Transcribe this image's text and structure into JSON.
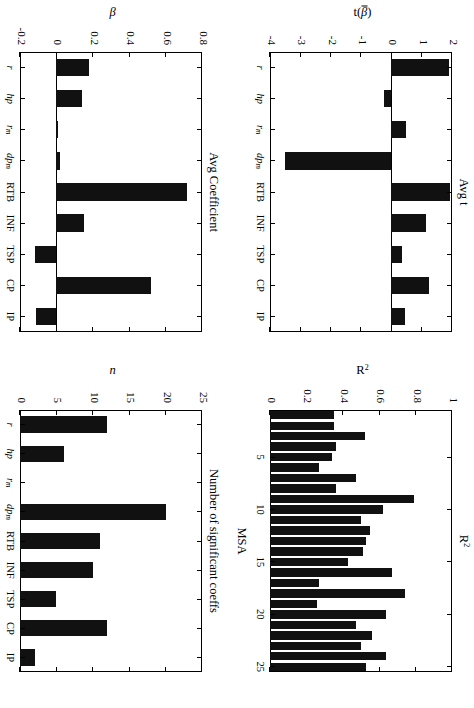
{
  "figure": {
    "orientation": "rotated-90-clockwise",
    "panel_count": 4
  },
  "chart_data": [
    {
      "id": "avg-t",
      "type": "bar",
      "title": "Avg t",
      "xlabel": "",
      "ylabel": "t(β̄)",
      "ylabel_parts": {
        "prefix": "t(",
        "symbol": "β",
        "suffix": ")",
        "overline": true
      },
      "categories": [
        "r",
        "hp",
        "r_m",
        "dp_m",
        "RTB",
        "INF",
        "TSP",
        "CP",
        "IP"
      ],
      "category_labels": [
        "r",
        "hp",
        "r",
        "dp",
        "RTB",
        "INF",
        "TSP",
        "CP",
        "IP"
      ],
      "category_subscripts": [
        "",
        "",
        "m",
        "m",
        "",
        "",
        "",
        "",
        ""
      ],
      "values": [
        1.9,
        -0.25,
        0.5,
        -3.5,
        1.95,
        1.15,
        0.35,
        1.25,
        0.45
      ],
      "ylim": [
        -4,
        2
      ],
      "yticks": [
        2,
        1,
        0,
        -1,
        -2,
        -3,
        -4
      ],
      "ytick_labels": [
        "2",
        "1",
        "0",
        "-1",
        "-2",
        "-3",
        "-4"
      ],
      "grid": false,
      "legend": "none"
    },
    {
      "id": "r-squared",
      "type": "bar",
      "title": "R²",
      "title_parts": {
        "base": "R",
        "sup": "2"
      },
      "xlabel": "MSA",
      "ylabel": "R²",
      "ylabel_parts": {
        "base": "R",
        "sup": "2"
      },
      "categories": [
        1,
        2,
        3,
        4,
        5,
        6,
        7,
        8,
        9,
        10,
        11,
        12,
        13,
        14,
        15,
        16,
        17,
        18,
        19,
        20,
        21,
        22,
        23,
        24,
        25
      ],
      "values": [
        0.35,
        0.35,
        0.52,
        0.36,
        0.34,
        0.27,
        0.47,
        0.36,
        0.79,
        0.62,
        0.5,
        0.55,
        0.53,
        0.51,
        0.43,
        0.67,
        0.27,
        0.74,
        0.26,
        0.64,
        0.47,
        0.56,
        0.5,
        0.64,
        0.53
      ],
      "ylim": [
        0,
        1
      ],
      "yticks": [
        1,
        0.8,
        0.6,
        0.4,
        0.2,
        0
      ],
      "ytick_labels": [
        "1",
        "0.8",
        "0.6",
        "0.4",
        "0.2",
        "0"
      ],
      "xticks": [
        5,
        10,
        15,
        20,
        25
      ],
      "xtick_labels": [
        "5",
        "10",
        "15",
        "20",
        "25"
      ],
      "grid": false,
      "legend": "none"
    },
    {
      "id": "avg-coefficient",
      "type": "bar",
      "title": "Avg Coefficient",
      "xlabel": "",
      "ylabel": "β",
      "categories": [
        "r",
        "hp",
        "r_m",
        "dp_m",
        "RTB",
        "INF",
        "TSP",
        "CP",
        "IP"
      ],
      "category_labels": [
        "r",
        "hp",
        "r",
        "dp",
        "RTB",
        "INF",
        "TSP",
        "CP",
        "IP"
      ],
      "category_subscripts": [
        "",
        "",
        "m",
        "m",
        "",
        "",
        "",
        "",
        ""
      ],
      "values": [
        0.18,
        0.14,
        0.01,
        0.02,
        0.72,
        0.15,
        -0.12,
        0.52,
        -0.11
      ],
      "ylim": [
        -0.2,
        0.8
      ],
      "yticks": [
        0.8,
        0.6,
        0.4,
        0.2,
        0,
        -0.2
      ],
      "ytick_labels": [
        "0.8",
        "0.6",
        "0.4",
        "0.2",
        "0",
        "-0.2"
      ],
      "grid": false,
      "legend": "none"
    },
    {
      "id": "significant-coeffs",
      "type": "bar",
      "title": "Number of significant coeffs",
      "xlabel": "",
      "ylabel": "n",
      "categories": [
        "r",
        "hp",
        "r_m",
        "dp_m",
        "RTB",
        "INF",
        "TSP",
        "CP",
        "IP"
      ],
      "category_labels": [
        "r",
        "hp",
        "r",
        "dp",
        "RTB",
        "INF",
        "TSP",
        "CP",
        "IP"
      ],
      "category_subscripts": [
        "",
        "",
        "m",
        "m",
        "",
        "",
        "",
        "",
        ""
      ],
      "values": [
        12,
        6,
        0,
        20,
        11,
        10,
        5,
        12,
        2
      ],
      "ylim": [
        0,
        25
      ],
      "yticks": [
        25,
        20,
        15,
        10,
        5,
        0
      ],
      "ytick_labels": [
        "25",
        "20",
        "15",
        "10",
        "5",
        "0"
      ],
      "grid": false,
      "legend": "none"
    }
  ],
  "colors": {
    "bar": "#111111",
    "axis": "#000000",
    "background": "#ffffff"
  }
}
